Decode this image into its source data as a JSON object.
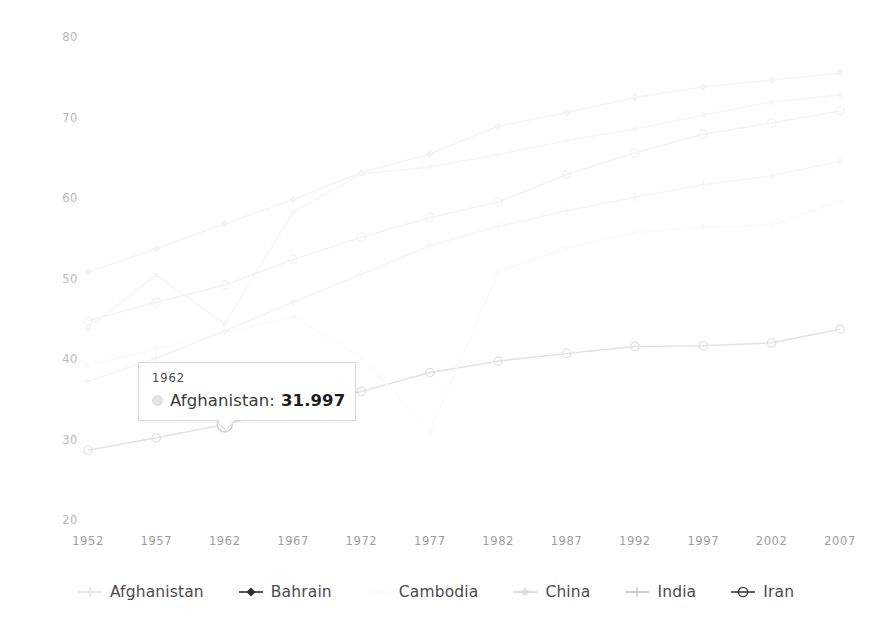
{
  "chart_data": {
    "type": "line",
    "title": "",
    "subtitle": "",
    "xlabel": "",
    "ylabel": "",
    "x": [
      1952,
      1957,
      1962,
      1967,
      1972,
      1977,
      1982,
      1987,
      1992,
      1997,
      2002,
      2007
    ],
    "xlim": [
      1952,
      2007
    ],
    "ylim": [
      20,
      80
    ],
    "ytick_labels": [
      "80",
      "70",
      "60",
      "50",
      "40",
      "30",
      "20"
    ],
    "ytick_values": [
      80,
      70,
      60,
      50,
      40,
      30,
      20
    ],
    "xtick_labels": [
      "1952",
      "1957",
      "1962",
      "1967",
      "1972",
      "1977",
      "1982",
      "1987",
      "1992",
      "1997",
      "2002",
      "2007"
    ],
    "grid": false,
    "legend_position": "bottom",
    "series": [
      {
        "name": "Afghanistan",
        "marker": "circle",
        "color": "#e2e2e2",
        "values": [
          28.801,
          30.332,
          31.997,
          34.02,
          36.088,
          38.438,
          39.854,
          40.822,
          41.674,
          41.763,
          42.129,
          43.828
        ]
      },
      {
        "name": "Bahrain",
        "marker": "diamond",
        "color": "#f4f4f4",
        "values": [
          50.939,
          53.832,
          56.923,
          59.923,
          63.3,
          65.593,
          69.052,
          70.75,
          72.601,
          73.925,
          74.795,
          75.635
        ]
      },
      {
        "name": "Cambodia",
        "marker": "dot",
        "color": "#fbfbfb",
        "values": [
          39.417,
          41.366,
          43.415,
          45.415,
          40.317,
          31.22,
          50.957,
          53.914,
          55.803,
          56.534,
          56.752,
          59.723
        ]
      },
      {
        "name": "China",
        "marker": "star",
        "color": "#f6f6f6",
        "values": [
          44.0,
          50.54896,
          44.50136,
          58.38112,
          63.11888,
          63.96736,
          65.525,
          67.274,
          68.69,
          70.426,
          72.028,
          72.961
        ]
      },
      {
        "name": "India",
        "marker": "plus",
        "color": "#f5f5f5",
        "values": [
          37.373,
          40.249,
          43.605,
          47.193,
          50.651,
          54.208,
          56.596,
          58.553,
          60.223,
          61.765,
          62.879,
          64.698
        ]
      },
      {
        "name": "Iran",
        "marker": "circle-dot",
        "color": "#f3f3f3",
        "values": [
          44.869,
          47.181,
          49.325,
          52.469,
          55.234,
          57.702,
          59.62,
          63.04,
          65.742,
          68.042,
          69.451,
          70.964
        ]
      }
    ],
    "highlight": {
      "series": "Afghanistan",
      "x": 1962,
      "y": 31.997
    }
  },
  "tooltip": {
    "title": "1962",
    "series_label": "Afghanistan:",
    "value": "31.997",
    "swatch_color": "#e4e4e4"
  },
  "legend": {
    "items": [
      {
        "label": "Afghanistan",
        "marker": "plus",
        "color": "#e3e3e3"
      },
      {
        "label": "Bahrain",
        "marker": "diamond",
        "color": "#2f2f2f"
      },
      {
        "label": "Cambodia",
        "marker": "dot",
        "color": "#fcfcfc"
      },
      {
        "label": "China",
        "marker": "star",
        "color": "#d8d8d8"
      },
      {
        "label": "India",
        "marker": "plus",
        "color": "#c9c9c9"
      },
      {
        "label": "Iran",
        "marker": "circle-dot",
        "color": "#3a3a3a"
      }
    ]
  },
  "axes": {
    "y_labels": [
      "80",
      "70",
      "60",
      "50",
      "40",
      "30",
      "20"
    ],
    "x_labels": [
      "1952",
      "1957",
      "1962",
      "1967",
      "1972",
      "1977",
      "1982",
      "1987",
      "1992",
      "1997",
      "2002",
      "2007"
    ]
  }
}
